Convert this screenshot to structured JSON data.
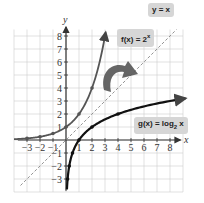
{
  "diagram": {
    "title": "",
    "axes": {
      "x_label": "x",
      "y_label": "y",
      "x_ticks": [
        -3,
        -2,
        -1,
        1,
        2,
        3,
        4,
        5,
        6,
        7,
        8
      ],
      "y_ticks": [
        -3,
        -2,
        -1,
        1,
        2,
        3,
        4,
        5,
        6,
        7,
        8
      ],
      "x_range": [
        -4,
        9
      ],
      "y_range": [
        -4,
        8.5
      ]
    },
    "labels": {
      "identity": "y = x",
      "exponential_prefix": "f(x) = 2",
      "exponential_exp": "x",
      "logarithmic_prefix": "g(x) = log",
      "logarithmic_base": "2",
      "logarithmic_suffix": " x"
    },
    "colors": {
      "grid": "#cfcfcf",
      "axis": "#333333",
      "exponential_curve": "#555555",
      "log_curve": "#111111",
      "identity_line": "#888888",
      "reflection_arrow": "#555555",
      "label_bg": "#d6d6d6"
    }
  },
  "chart_data": {
    "type": "line",
    "title": "",
    "xlabel": "x",
    "ylabel": "y",
    "xlim": [
      -4,
      9
    ],
    "ylim": [
      -4,
      8.5
    ],
    "grid": true,
    "series": [
      {
        "name": "f(x) = 2^x",
        "points": [
          [
            -3,
            0.125
          ],
          [
            -2,
            0.25
          ],
          [
            -1,
            0.5
          ],
          [
            0,
            1
          ],
          [
            1,
            2
          ],
          [
            2,
            4
          ],
          [
            3,
            8
          ]
        ]
      },
      {
        "name": "g(x) = log2 x",
        "points": [
          [
            0.125,
            -3
          ],
          [
            0.25,
            -2
          ],
          [
            0.5,
            -1
          ],
          [
            1,
            0
          ],
          [
            2,
            1
          ],
          [
            4,
            2
          ],
          [
            8,
            3
          ]
        ]
      },
      {
        "name": "y = x",
        "style": "dashed",
        "points": [
          [
            -3.5,
            -3.5
          ],
          [
            8.5,
            8.5
          ]
        ]
      }
    ],
    "annotations": [
      "y = x",
      "f(x) = 2^x",
      "g(x) = log2 x",
      "curved reflection arrow from f to g across y = x"
    ]
  }
}
